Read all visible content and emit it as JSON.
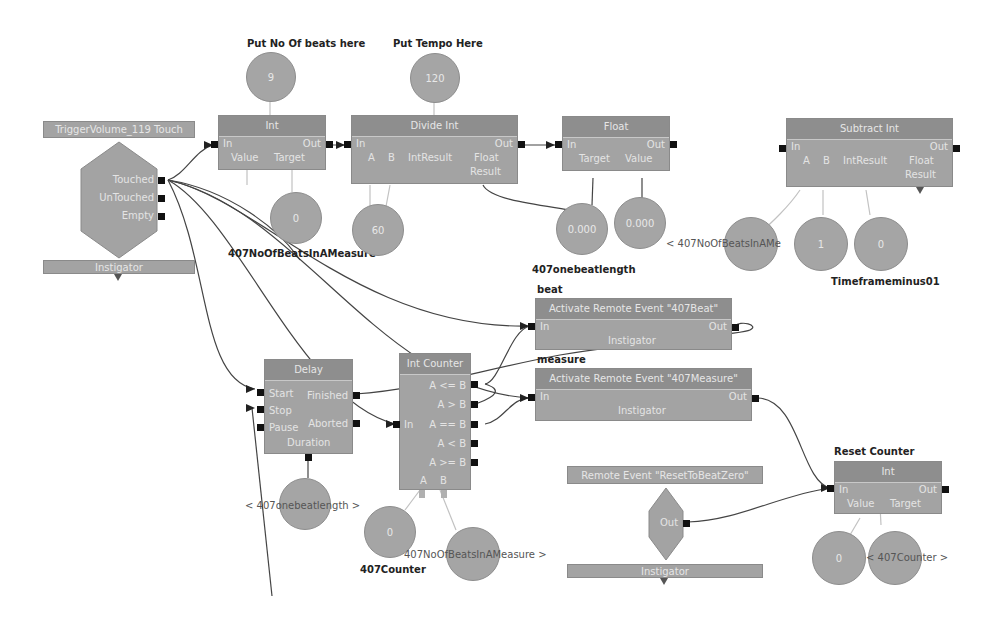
{
  "captions": {
    "put_beats": "Put No Of beats here",
    "put_tempo": "Put Tempo Here",
    "beat": "beat",
    "measure": "measure",
    "reset_counter": "Reset Counter",
    "var_no_beats": "407NoOfBeatsInAMeasure",
    "var_onebeat": "407onebeatlength",
    "var_timeframe": "Timeframeminus01",
    "var_counter": "407Counter",
    "ref_no_beats_sub": "< 407NoOfBeatsInAMe",
    "ref_onebeat_delay": "< 407onebeatlength >",
    "ref_no_beats_counter": "407NoOfBeatsInAMeasure >",
    "ref_counter_reset": "< 407Counter >"
  },
  "trigger": {
    "title": "TriggerVolume_119 Touch",
    "outputs": [
      "Touched",
      "UnTouched",
      "Empty"
    ],
    "instigator": "Instigator"
  },
  "remote_event": {
    "title": "Remote Event \"ResetToBeatZero\"",
    "output": "Out",
    "instigator": "Instigator"
  },
  "nodes": {
    "int1": {
      "title": "Int",
      "in": "In",
      "out": "Out",
      "vars": [
        "Value",
        "Target"
      ]
    },
    "divide": {
      "title": "Divide Int",
      "in": "In",
      "out": "Out",
      "vars": [
        "A",
        "B",
        "IntResult",
        "Float",
        "Result"
      ]
    },
    "float": {
      "title": "Float",
      "in": "In",
      "out": "Out",
      "vars": [
        "Target",
        "Value"
      ]
    },
    "subtract": {
      "title": "Subtract Int",
      "in": "In",
      "out": "Out",
      "vars": [
        "A",
        "B",
        "IntResult",
        "Float",
        "Result"
      ]
    },
    "beat_event": {
      "title": "Activate Remote Event \"407Beat\"",
      "in": "In",
      "out": "Out",
      "var": "Instigator"
    },
    "measure_event": {
      "title": "Activate Remote Event \"407Measure\"",
      "in": "In",
      "out": "Out",
      "var": "Instigator"
    },
    "delay": {
      "title": "Delay",
      "inputs": [
        "Start",
        "Stop",
        "Pause"
      ],
      "outputs": [
        "Finished",
        "Aborted"
      ],
      "var": "Duration"
    },
    "counter": {
      "title": "Int Counter",
      "in": "In",
      "outputs": [
        "A <= B",
        "A > B",
        "A == B",
        "A < B",
        "A >= B"
      ],
      "vars": [
        "A",
        "B"
      ]
    },
    "reset_int": {
      "title": "Int",
      "in": "In",
      "out": "Out",
      "vars": [
        "Value",
        "Target"
      ]
    }
  },
  "variables": {
    "beats_const": "9",
    "tempo_const": "120",
    "no_beats_var": "0",
    "sixty_const": "60",
    "float_a": "0.000",
    "float_b": "0.000",
    "sub_ref": "",
    "sub_one": "1",
    "sub_result": "0",
    "delay_ref": "",
    "counter_var": "0",
    "counter_ref": "",
    "reset_zero": "0",
    "reset_ref": ""
  }
}
